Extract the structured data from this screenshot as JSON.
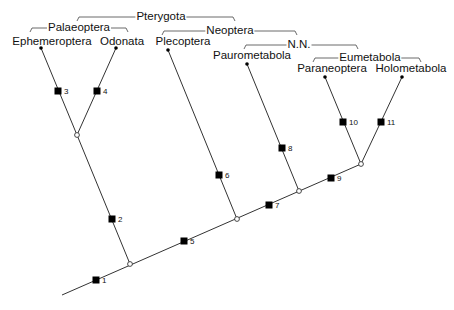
{
  "diagram": {
    "type": "cladogram",
    "taxa": [
      {
        "id": "ephemeroptera",
        "label": "Ephemeroptera",
        "tip": [
          41,
          48
        ],
        "label_pos": [
          52,
          36
        ]
      },
      {
        "id": "odonata",
        "label": "Odonata",
        "tip": [
          116,
          48
        ],
        "label_pos": [
          122,
          36
        ]
      },
      {
        "id": "plecoptera",
        "label": "Plecoptera",
        "tip": [
          168,
          50
        ],
        "label_pos": [
          183,
          36
        ]
      },
      {
        "id": "paurometabola",
        "label": "Paurometabola",
        "tip": [
          247,
          64
        ],
        "label_pos": [
          252,
          50
        ]
      },
      {
        "id": "paraneoptera",
        "label": "Paraneoptera",
        "tip": [
          325,
          77
        ],
        "label_pos": [
          332,
          63
        ]
      },
      {
        "id": "holometabola",
        "label": "Holometabola",
        "tip": [
          402,
          77
        ],
        "label_pos": [
          411,
          63
        ]
      }
    ],
    "nodes": [
      {
        "id": "root",
        "pos": [
          130,
          264
        ]
      },
      {
        "id": "palaeoptera",
        "pos": [
          77,
          135
        ]
      },
      {
        "id": "neoptera",
        "pos": [
          237,
          219
        ]
      },
      {
        "id": "nn",
        "pos": [
          299,
          191
        ]
      },
      {
        "id": "eumetabola",
        "pos": [
          361,
          164
        ]
      }
    ],
    "backbone": {
      "start": [
        62,
        295
      ],
      "end": [
        361,
        164
      ]
    },
    "branches": [
      {
        "from": "root",
        "to": "palaeoptera"
      },
      {
        "from": "palaeoptera",
        "to": "ephemeroptera"
      },
      {
        "from": "palaeoptera",
        "to": "odonata"
      },
      {
        "from": "neoptera",
        "to": "plecoptera"
      },
      {
        "from": "nn",
        "to": "paurometabola"
      },
      {
        "from": "eumetabola",
        "to": "paraneoptera"
      },
      {
        "from": "eumetabola",
        "to": "holometabola"
      }
    ],
    "markers": [
      {
        "label": "1",
        "pos": [
          96,
          280
        ]
      },
      {
        "label": "2",
        "pos": [
          112,
          219
        ]
      },
      {
        "label": "3",
        "pos": [
          58,
          91
        ]
      },
      {
        "label": "4",
        "pos": [
          97,
          91
        ]
      },
      {
        "label": "5",
        "pos": [
          184,
          241
        ]
      },
      {
        "label": "6",
        "pos": [
          219,
          175
        ]
      },
      {
        "label": "7",
        "pos": [
          269,
          205
        ]
      },
      {
        "label": "8",
        "pos": [
          282,
          148
        ]
      },
      {
        "label": "9",
        "pos": [
          331,
          178
        ]
      },
      {
        "label": "10",
        "pos": [
          343,
          122
        ]
      },
      {
        "label": "11",
        "pos": [
          381,
          122
        ]
      }
    ],
    "groups": [
      {
        "id": "pterygota",
        "label": "Pterygota",
        "x1": 77,
        "x2": 235,
        "y": 17,
        "label_x": 161
      },
      {
        "id": "palaeoptera-group",
        "label": "Palaeoptera",
        "x1": 30,
        "x2": 128,
        "y": 28,
        "label_x": 79
      },
      {
        "id": "neoptera-group",
        "label": "Neoptera",
        "x1": 162,
        "x2": 297,
        "y": 31,
        "label_x": 230
      },
      {
        "id": "nn-group",
        "label": "N.N.",
        "x1": 244,
        "x2": 358,
        "y": 45,
        "label_x": 299
      },
      {
        "id": "eumetabola-group",
        "label": "Eumetabola",
        "x1": 313,
        "x2": 421,
        "y": 58,
        "label_x": 370
      }
    ],
    "colors": {
      "line": "#333333",
      "marker": "#000000",
      "text": "#111111",
      "background": "#ffffff"
    }
  }
}
